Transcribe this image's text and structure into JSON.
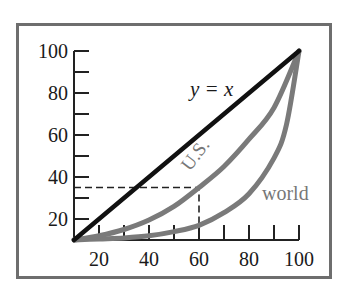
{
  "chart_data": {
    "type": "line",
    "title": "",
    "xlabel": "",
    "ylabel": "",
    "xlim": [
      10,
      100
    ],
    "ylim": [
      10,
      100
    ],
    "grid": false,
    "legend": "inline labels",
    "x_ticks": [
      20,
      30,
      40,
      50,
      60,
      70,
      80,
      90,
      100
    ],
    "x_tick_labels": [
      "20",
      "40",
      "60",
      "80",
      "100"
    ],
    "y_ticks": [
      20,
      30,
      40,
      50,
      60,
      70,
      80,
      90,
      100
    ],
    "y_tick_labels": [
      "20",
      "40",
      "60",
      "80",
      "100"
    ],
    "series": [
      {
        "name": "y = x",
        "color": "#111111",
        "x": [
          10,
          100
        ],
        "y": [
          10,
          100
        ]
      },
      {
        "name": "U.S.",
        "color": "#7a7a7a",
        "x": [
          10,
          20,
          30,
          40,
          50,
          60,
          70,
          80,
          90,
          100
        ],
        "y": [
          10,
          12,
          15,
          19.5,
          26,
          35,
          45,
          58,
          73,
          100
        ]
      },
      {
        "name": "world",
        "color": "#7a7a7a",
        "x": [
          10,
          20,
          30,
          40,
          50,
          60,
          70,
          80,
          90,
          95,
          100
        ],
        "y": [
          10,
          10.5,
          11,
          12,
          14,
          17,
          23,
          32,
          49,
          65,
          100
        ]
      }
    ],
    "annotations": [
      {
        "text": "y = x",
        "near": [
          70,
          82
        ]
      },
      {
        "text": "U.S.",
        "near": [
          60,
          52
        ],
        "rotation": -52
      },
      {
        "text": "world",
        "near": [
          88,
          29
        ]
      },
      {
        "text": "dashed guide",
        "from": [
          10,
          35
        ],
        "corner": [
          60,
          35
        ],
        "to": [
          60,
          10
        ]
      }
    ]
  },
  "labels": {
    "diagonal": "y = x",
    "us": "U.S.",
    "world": "world",
    "x_ticks": [
      "20",
      "40",
      "60",
      "80",
      "100"
    ],
    "y_ticks": [
      "20",
      "40",
      "60",
      "80",
      "100"
    ]
  }
}
